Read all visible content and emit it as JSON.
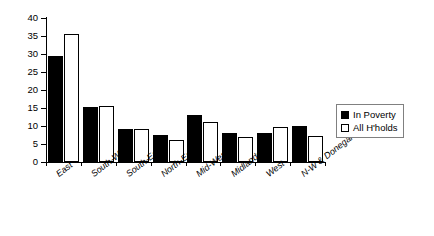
{
  "chart_data": {
    "type": "bar",
    "title": "",
    "subtitle": "",
    "xlabel": "",
    "ylabel": "",
    "ylim": [
      0,
      40
    ],
    "ytick_step": 5,
    "yticks": [
      0,
      5,
      10,
      15,
      20,
      25,
      30,
      35,
      40
    ],
    "grid": false,
    "legend_position": "right",
    "categories": [
      "East",
      "South-West",
      "South-East",
      "North-East",
      "Mid-West",
      "Midlands",
      "West",
      "N-W & Donegal"
    ],
    "series": [
      {
        "name": "In Poverty",
        "color": "#000000",
        "style": "filled",
        "values": [
          29.5,
          15.3,
          9.2,
          7.4,
          13.1,
          8.0,
          8.1,
          10.0
        ]
      },
      {
        "name": "All H'holds",
        "color": "#ffffff",
        "style": "hollow",
        "values": [
          35.6,
          15.5,
          9.1,
          6.0,
          11.0,
          6.9,
          9.7,
          7.2
        ]
      }
    ]
  },
  "legend": {
    "items": [
      {
        "label": "In Poverty",
        "swatch": "filled"
      },
      {
        "label": "All H'holds",
        "swatch": "hollow"
      }
    ]
  }
}
